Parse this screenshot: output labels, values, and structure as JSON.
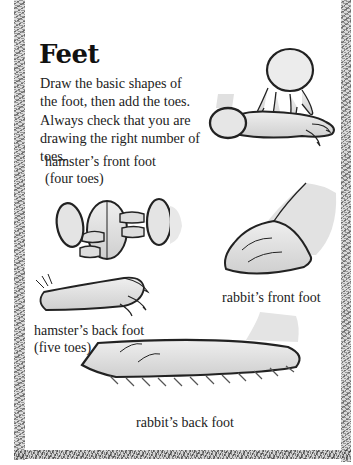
{
  "page": {
    "title": "Feet",
    "intro": "Draw the basic shapes of the foot, then add the toes. Always check that you are drawing the right number of toes."
  },
  "illustrations": [
    {
      "id": "hamster-front-foot",
      "caption_line1": "hamster’s front foot",
      "caption_line2": "(four toes)"
    },
    {
      "id": "rabbit-front-foot",
      "caption_line1": "rabbit’s front foot"
    },
    {
      "id": "hamster-back-foot",
      "caption_line1": "hamster’s back foot",
      "caption_line2": "(five toes)"
    },
    {
      "id": "rabbit-back-foot",
      "caption_line1": "rabbit’s back foot"
    }
  ],
  "colors": {
    "ink": "#222222",
    "shade": "#d9d9d9",
    "border": "#888888"
  }
}
